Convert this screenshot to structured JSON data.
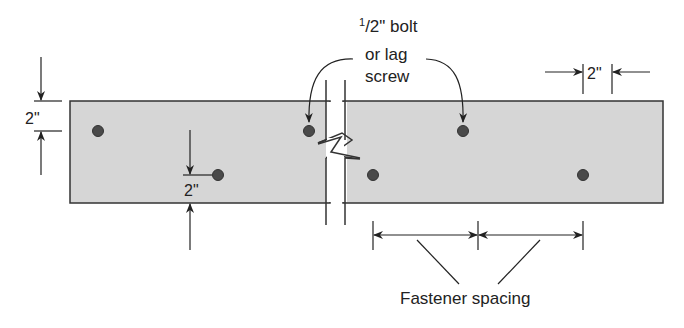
{
  "diagram": {
    "callout": {
      "line1_sup": "1",
      "line1_rest": "/2\" bolt",
      "line2": "or lag",
      "line3": "screw"
    },
    "dimensions": {
      "edge_distance_left": "2\"",
      "edge_distance_inner": "2\"",
      "end_distance_right": "2\""
    },
    "spacing_label": "Fastener spacing",
    "colors": {
      "plank_fill": "#d6d6d6",
      "outline": "#333333",
      "fastener": "#4a4a4a",
      "background": "#ffffff"
    }
  }
}
